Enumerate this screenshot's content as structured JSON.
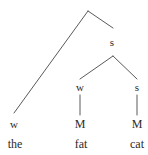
{
  "figure": {
    "name": "metrical-tree-diagram",
    "width": 148,
    "height": 155,
    "background_color": "#ffffff",
    "stroke_color": "#5a5a5a",
    "text_color": "#2b2b2b"
  },
  "nodes": [
    {
      "id": "root",
      "label": "",
      "x": 88,
      "y": 11,
      "kind": "junction"
    },
    {
      "id": "s-upper",
      "label": "s",
      "x": 112,
      "y": 42,
      "kind": "strength"
    },
    {
      "id": "w-mid",
      "label": "w",
      "x": 80,
      "y": 87,
      "kind": "strength"
    },
    {
      "id": "s-mid",
      "label": "s",
      "x": 137,
      "y": 87,
      "kind": "strength"
    },
    {
      "id": "w-left",
      "label": "w",
      "x": 14,
      "y": 124,
      "kind": "strength"
    },
    {
      "id": "m-mid",
      "label": "M",
      "x": 80,
      "y": 124,
      "kind": "strength-cap"
    },
    {
      "id": "m-right",
      "label": "M",
      "x": 137,
      "y": 124,
      "kind": "strength-cap"
    },
    {
      "id": "word-the",
      "label": "the",
      "x": 15,
      "y": 144,
      "kind": "word"
    },
    {
      "id": "word-fat",
      "label": "fat",
      "x": 81,
      "y": 144,
      "kind": "word"
    },
    {
      "id": "word-cat",
      "label": "cat",
      "x": 137,
      "y": 144,
      "kind": "word"
    }
  ],
  "edges": [
    {
      "id": "root-to-w-left",
      "x1": 88,
      "y1": 11,
      "x2": 14,
      "y2": 113
    },
    {
      "id": "root-to-s-upper",
      "x1": 88,
      "y1": 11,
      "x2": 113,
      "y2": 28
    },
    {
      "id": "s-upper-to-w-mid",
      "x1": 113,
      "y1": 56,
      "x2": 80,
      "y2": 79
    },
    {
      "id": "s-upper-to-s-mid",
      "x1": 113,
      "y1": 56,
      "x2": 137,
      "y2": 79
    },
    {
      "id": "w-mid-to-m-mid",
      "x1": 80,
      "y1": 95,
      "x2": 80,
      "y2": 115
    },
    {
      "id": "s-mid-to-m-right",
      "x1": 137,
      "y1": 95,
      "x2": 137,
      "y2": 115
    }
  ]
}
